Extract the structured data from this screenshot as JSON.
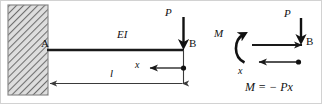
{
  "figure": {
    "title_semantic": "cantilever-beam-bending-moment-diagram",
    "colors": {
      "ink": "#111111",
      "beam": "#1a1a1a",
      "dimension_line": "#3a3a3a",
      "hatch": "#6e6e6e",
      "wall_fill": "#d9d9d9",
      "frame": "#cfcfcf",
      "background": "#ffffff"
    }
  },
  "left_diagram": {
    "name": "cantilever-beam-with-end-load",
    "wall": {
      "name": "fixed-support-wall",
      "hatch_pattern": "diagonal-hatch"
    },
    "labels": {
      "support_point": "A",
      "flexural_rigidity": "EI",
      "end_point": "B",
      "load": "P",
      "distance_from_end": "x",
      "beam_length": "l"
    }
  },
  "right_diagram": {
    "name": "free-body-section-diagram",
    "labels": {
      "moment": "M",
      "load": "P",
      "end_point": "B",
      "distance_from_end": "x"
    },
    "equation": "M = − Px"
  }
}
